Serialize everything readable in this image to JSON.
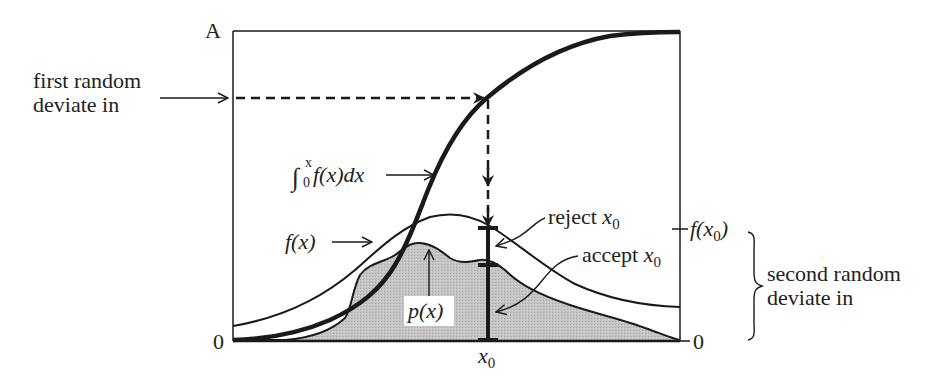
{
  "figure": {
    "colors": {
      "ink": "#1a1a1a",
      "shade": "#bdbdbd",
      "background": "#ffffff"
    },
    "axis": {
      "y_top_label": "A",
      "y_bottom_label": "0",
      "right_bottom_label": "0",
      "right_tick_label_main": "f(x",
      "right_tick_label_sub": "0",
      "right_tick_label_end": ")",
      "x0_label_main": "x",
      "x0_label_sub": "0"
    },
    "labels": {
      "first_random_line1": "first random",
      "first_random_line2": "deviate in",
      "second_random_line1": "second random",
      "second_random_line2": "deviate in",
      "integral_sup": "x",
      "integral_sub": "0",
      "integral_body": "f(x)dx",
      "fx": "f(x)",
      "px": "p(x)",
      "reject_word": "reject ",
      "reject_var": "x",
      "reject_sub": "0",
      "accept_word": "accept ",
      "accept_var": "x",
      "accept_sub": "0"
    },
    "curves": [
      {
        "name": "cumulative integral of f(x)",
        "style": "thick",
        "shape": "sigmoid from 0 to A"
      },
      {
        "name": "f(x)",
        "style": "thin",
        "shape": "comparison function bump, peak near middle"
      },
      {
        "name": "p(x)",
        "style": "thin, shaded area below",
        "shape": "target density, wavy, below f(x)"
      }
    ]
  }
}
